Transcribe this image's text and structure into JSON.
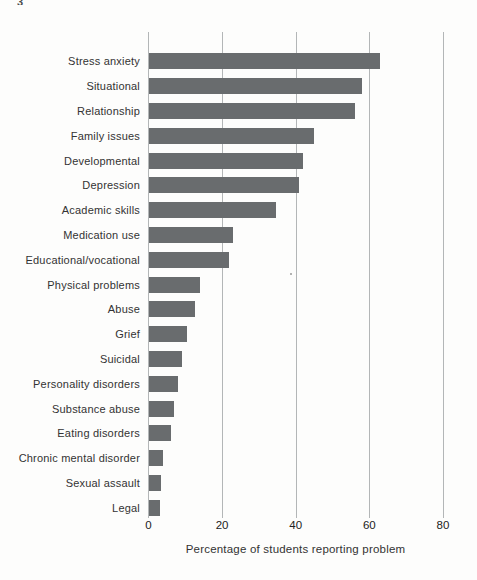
{
  "page_artifact": "3",
  "chart_data": {
    "type": "bar",
    "orientation": "horizontal",
    "title": "",
    "xlabel": "Percentage of students reporting problem",
    "ylabel": "",
    "xlim": [
      0,
      80
    ],
    "xticks": [
      0,
      20,
      40,
      60,
      80
    ],
    "grid": "vertical-lines-on",
    "legend": "none",
    "bar_color": "#696c6e",
    "gridline_color": "#b3b6b7",
    "categories": [
      "Stress anxiety",
      "Situational",
      "Relationship",
      "Family issues",
      "Developmental",
      "Depression",
      "Academic skills",
      "Medication use",
      "Educational/vocational",
      "Physical problems",
      "Abuse",
      "Grief",
      "Suicidal",
      "Personality disorders",
      "Substance abuse",
      "Eating disorders",
      "Chronic mental disorder",
      "Sexual assault",
      "Legal"
    ],
    "values": [
      63,
      58,
      56,
      45,
      42,
      41,
      34.5,
      23,
      22,
      14,
      12.5,
      10.5,
      9,
      8,
      7,
      6,
      4,
      3.5,
      3
    ]
  }
}
